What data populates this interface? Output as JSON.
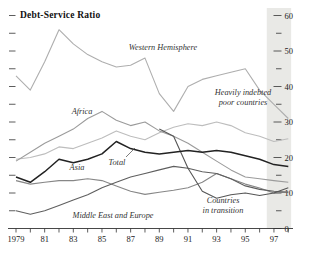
{
  "chart_data": {
    "type": "line",
    "title": "Debt-Service Ratio",
    "x_start": 1979,
    "x_end": 1998,
    "ylim": [
      0,
      60
    ],
    "y_major_ticks": [
      0,
      10,
      20,
      30,
      40,
      50,
      60
    ],
    "y_minor_ticks": [
      5,
      15,
      25,
      35,
      45,
      55
    ],
    "x_tick_labels": [
      {
        "year": 1979,
        "label": "1979"
      },
      {
        "year": 1981,
        "label": "81"
      },
      {
        "year": 1983,
        "label": "83"
      },
      {
        "year": 1985,
        "label": "85"
      },
      {
        "year": 1987,
        "label": "87"
      },
      {
        "year": 1989,
        "label": "89"
      },
      {
        "year": 1991,
        "label": "91"
      },
      {
        "year": 1993,
        "label": "93"
      },
      {
        "year": 1995,
        "label": "95"
      },
      {
        "year": 1997,
        "label": "97"
      }
    ],
    "projection_band": {
      "from": 1996.5,
      "to": 1998.2,
      "color": "#e9e9e6"
    },
    "series": [
      {
        "name": "Western Hemisphere",
        "color": "#aeaeae",
        "width": 1.1,
        "values": [
          43,
          39,
          47,
          56,
          52,
          49,
          47,
          45.5,
          46,
          48,
          38,
          33,
          40,
          42,
          43,
          44,
          45,
          39,
          35,
          31
        ]
      },
      {
        "name": "Heavily indebted poor countries",
        "color": "#bdbdbd",
        "width": 1.1,
        "values": [
          19.5,
          20,
          21,
          23,
          22.5,
          24,
          25.5,
          27.5,
          26,
          25,
          27,
          28.5,
          29.5,
          29,
          30,
          29,
          27,
          26,
          24.5,
          25.3
        ]
      },
      {
        "name": "Africa",
        "color": "#9b9b9b",
        "width": 1.1,
        "values": [
          19,
          21.5,
          24,
          26,
          28,
          31,
          33,
          30.5,
          29,
          30,
          27.5,
          26,
          24,
          21.5,
          19,
          16.5,
          14.5,
          14,
          13.5,
          13
        ]
      },
      {
        "name": "Asia",
        "color": "#878787",
        "width": 1.1,
        "values": [
          13.5,
          12.5,
          13,
          13.5,
          13.5,
          14,
          13.5,
          12,
          10.5,
          9.6,
          10.2,
          10.8,
          11.5,
          13,
          15.5,
          14,
          12.5,
          11.4,
          10,
          10.3
        ]
      },
      {
        "name": "Middle East and Europe",
        "color": "#5f5f5f",
        "width": 1.1,
        "values": [
          5,
          4,
          5,
          6.5,
          8,
          9.5,
          11.5,
          13,
          14.5,
          15.5,
          16.5,
          17.5,
          17,
          16,
          15.5,
          14,
          12,
          11,
          10.5,
          10.2
        ]
      },
      {
        "name": "Countries in transition",
        "color": "#565656",
        "width": 1.1,
        "values": [
          null,
          null,
          null,
          null,
          null,
          null,
          null,
          null,
          null,
          null,
          28,
          26,
          17,
          10.5,
          8.5,
          9.5,
          10,
          9.3,
          10,
          11.5
        ]
      },
      {
        "name": "Total",
        "color": "#222222",
        "width": 1.5,
        "values": [
          14.5,
          13,
          16,
          19.5,
          18.5,
          19.5,
          21,
          24.5,
          22.5,
          21.5,
          21,
          21.5,
          22,
          21.5,
          22,
          21.5,
          20.5,
          19.5,
          18,
          17.5
        ]
      }
    ],
    "annotations": [
      {
        "name": "label-western-hemisphere",
        "lines": [
          "Western Hemisphere"
        ],
        "x": 163,
        "y": 50
      },
      {
        "name": "label-hipc",
        "lines": [
          "Heavily indebted",
          "poor countries"
        ],
        "x": 243,
        "y": 95
      },
      {
        "name": "label-africa",
        "lines": [
          "Africa"
        ],
        "x": 82,
        "y": 114
      },
      {
        "name": "label-total",
        "lines": [
          "Total"
        ],
        "x": 117,
        "y": 165
      },
      {
        "name": "label-asia",
        "lines": [
          "Asia"
        ],
        "x": 77,
        "y": 170
      },
      {
        "name": "label-middle-east-europe",
        "lines": [
          "Middle East and Europe"
        ],
        "x": 113,
        "y": 218
      },
      {
        "name": "label-countries-transition",
        "lines": [
          "Countries",
          "in transition"
        ],
        "x": 223,
        "y": 203
      }
    ],
    "pointer": {
      "x1": 126,
      "y1": 157,
      "x2": 135,
      "y2": 148
    }
  }
}
